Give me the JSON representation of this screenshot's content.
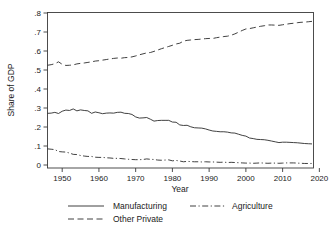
{
  "chart_data": {
    "type": "line",
    "title": "",
    "xlabel": "Year",
    "ylabel": "Share of GDP",
    "xlim": [
      1946,
      2018
    ],
    "ylim": [
      0,
      0.8
    ],
    "grid": false,
    "legend_position": "bottom",
    "x_ticks": [
      1950,
      1960,
      1970,
      1980,
      1990,
      2000,
      2010,
      2020
    ],
    "x_tick_labels": [
      "1950",
      "1960",
      "1970",
      "1980",
      "1990",
      "2000",
      "2010",
      "2020"
    ],
    "y_ticks": [
      0,
      0.1,
      0.2,
      0.3,
      0.4,
      0.5,
      0.6,
      0.7,
      0.8
    ],
    "y_tick_labels": [
      "0",
      ".1",
      ".2",
      ".3",
      ".4",
      ".5",
      ".6",
      ".7",
      ".8"
    ],
    "x": [
      1946,
      1947,
      1948,
      1949,
      1950,
      1951,
      1952,
      1953,
      1954,
      1955,
      1956,
      1957,
      1958,
      1959,
      1960,
      1961,
      1962,
      1963,
      1964,
      1965,
      1966,
      1967,
      1968,
      1969,
      1970,
      1971,
      1972,
      1973,
      1974,
      1975,
      1976,
      1977,
      1978,
      1979,
      1980,
      1981,
      1982,
      1983,
      1984,
      1985,
      1986,
      1987,
      1988,
      1989,
      1990,
      1991,
      1992,
      1993,
      1994,
      1995,
      1996,
      1997,
      1998,
      1999,
      2000,
      2001,
      2002,
      2003,
      2004,
      2005,
      2006,
      2007,
      2008,
      2009,
      2010,
      2011,
      2012,
      2013,
      2014,
      2015,
      2016,
      2017,
      2018
    ],
    "series": [
      {
        "name": "Manufacturing",
        "style": "solid",
        "values": [
          0.272,
          0.273,
          0.277,
          0.271,
          0.283,
          0.289,
          0.287,
          0.295,
          0.285,
          0.29,
          0.287,
          0.285,
          0.272,
          0.279,
          0.275,
          0.27,
          0.273,
          0.274,
          0.273,
          0.277,
          0.278,
          0.272,
          0.271,
          0.266,
          0.253,
          0.247,
          0.248,
          0.25,
          0.241,
          0.231,
          0.234,
          0.235,
          0.235,
          0.235,
          0.226,
          0.225,
          0.211,
          0.208,
          0.209,
          0.201,
          0.196,
          0.195,
          0.194,
          0.19,
          0.184,
          0.179,
          0.177,
          0.175,
          0.175,
          0.173,
          0.169,
          0.168,
          0.162,
          0.156,
          0.152,
          0.142,
          0.139,
          0.135,
          0.134,
          0.133,
          0.13,
          0.126,
          0.122,
          0.118,
          0.12,
          0.12,
          0.119,
          0.118,
          0.117,
          0.115,
          0.113,
          0.112,
          0.111
        ]
      },
      {
        "name": "Agriculture",
        "style": "dashdot",
        "values": [
          0.085,
          0.083,
          0.081,
          0.071,
          0.069,
          0.068,
          0.063,
          0.056,
          0.055,
          0.05,
          0.047,
          0.045,
          0.045,
          0.041,
          0.04,
          0.04,
          0.038,
          0.037,
          0.035,
          0.035,
          0.034,
          0.032,
          0.03,
          0.029,
          0.028,
          0.028,
          0.029,
          0.032,
          0.03,
          0.029,
          0.026,
          0.025,
          0.026,
          0.027,
          0.022,
          0.024,
          0.021,
          0.017,
          0.019,
          0.018,
          0.017,
          0.017,
          0.016,
          0.017,
          0.016,
          0.016,
          0.015,
          0.014,
          0.015,
          0.013,
          0.014,
          0.013,
          0.012,
          0.011,
          0.01,
          0.01,
          0.009,
          0.01,
          0.011,
          0.01,
          0.009,
          0.01,
          0.01,
          0.009,
          0.01,
          0.011,
          0.011,
          0.011,
          0.01,
          0.009,
          0.008,
          0.008,
          0.008
        ]
      },
      {
        "name": "Other Private",
        "style": "dashed",
        "values": [
          0.525,
          0.528,
          0.533,
          0.543,
          0.53,
          0.524,
          0.525,
          0.527,
          0.532,
          0.535,
          0.537,
          0.54,
          0.543,
          0.547,
          0.549,
          0.552,
          0.555,
          0.558,
          0.561,
          0.563,
          0.562,
          0.565,
          0.566,
          0.569,
          0.574,
          0.58,
          0.585,
          0.59,
          0.592,
          0.598,
          0.605,
          0.612,
          0.618,
          0.624,
          0.63,
          0.637,
          0.641,
          0.652,
          0.656,
          0.658,
          0.66,
          0.661,
          0.663,
          0.665,
          0.666,
          0.666,
          0.67,
          0.673,
          0.676,
          0.678,
          0.683,
          0.69,
          0.699,
          0.708,
          0.716,
          0.718,
          0.722,
          0.726,
          0.73,
          0.733,
          0.737,
          0.737,
          0.736,
          0.735,
          0.738,
          0.741,
          0.744,
          0.746,
          0.749,
          0.751,
          0.752,
          0.754,
          0.756
        ]
      }
    ]
  },
  "legend": {
    "items": [
      {
        "label": "Manufacturing",
        "style": "solid"
      },
      {
        "label": "Agriculture",
        "style": "dashdot"
      },
      {
        "label": "Other Private",
        "style": "dashed"
      }
    ]
  }
}
